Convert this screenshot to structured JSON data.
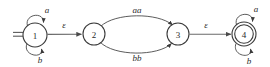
{
  "figure": {
    "kind": "finite-automaton-state-diagram",
    "background_color": "#ffffff",
    "stroke_color": "#5a5a5a",
    "text_color": "#2b2b2b"
  },
  "states": [
    {
      "id": "1",
      "label": "1",
      "cx": 35,
      "cy": 35,
      "r": 12,
      "accepting": false,
      "start": true
    },
    {
      "id": "2",
      "label": "2",
      "cx": 94,
      "cy": 34,
      "r": 11,
      "accepting": false,
      "start": false
    },
    {
      "id": "3",
      "label": "3",
      "cx": 178,
      "cy": 34,
      "r": 11,
      "accepting": false,
      "start": false
    },
    {
      "id": "4",
      "label": "4",
      "cx": 244,
      "cy": 34,
      "r": 12,
      "accepting": true,
      "start": false
    }
  ],
  "transitions": [
    {
      "id": "t1",
      "from": "1",
      "to": "1",
      "label": "a",
      "kind": "self-loop-top"
    },
    {
      "id": "t2",
      "from": "1",
      "to": "1",
      "label": "b",
      "kind": "self-loop-bottom"
    },
    {
      "id": "t3",
      "from": "1",
      "to": "2",
      "label": "ε",
      "kind": "straight"
    },
    {
      "id": "t4",
      "from": "2",
      "to": "3",
      "label": "aa",
      "kind": "arc-upper"
    },
    {
      "id": "t5",
      "from": "2",
      "to": "3",
      "label": "bb",
      "kind": "arc-lower"
    },
    {
      "id": "t6",
      "from": "3",
      "to": "4",
      "label": "ε",
      "kind": "straight"
    },
    {
      "id": "t7",
      "from": "4",
      "to": "4",
      "label": "a",
      "kind": "self-loop-top"
    },
    {
      "id": "t8",
      "from": "4",
      "to": "4",
      "label": "b",
      "kind": "self-loop-bottom"
    }
  ],
  "labels": {
    "state_1": "1",
    "state_2": "2",
    "state_3": "3",
    "state_4": "4",
    "loop_1_top": "a",
    "loop_1_bottom": "b",
    "eps_1_2": "ε",
    "arc_upper": "aa",
    "arc_lower": "bb",
    "eps_3_4": "ε",
    "loop_4_top": "a",
    "loop_4_bottom": "b"
  }
}
